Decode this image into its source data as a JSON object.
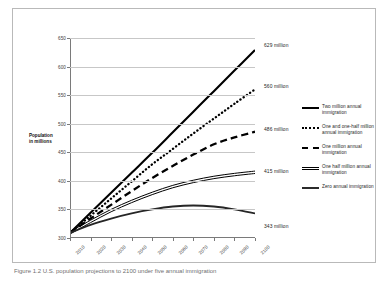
{
  "figure": {
    "caption": "Figure 1.2  U.S. population projections to 2100 under five annual immigration"
  },
  "axis": {
    "y_title_line1": "Population",
    "y_title_line2": "in millions"
  },
  "chart_data": {
    "type": "line",
    "title": "",
    "xlabel": "",
    "ylabel": "Population in millions",
    "xlim": [
      2010,
      2100
    ],
    "ylim": [
      300,
      650
    ],
    "ytick_step": 50,
    "grid": true,
    "legend_position": "right",
    "x": [
      2010,
      2020,
      2030,
      2040,
      2050,
      2060,
      2070,
      2080,
      2090,
      2100
    ],
    "xtick_labels": [
      "2010",
      "2020",
      "2030",
      "2040",
      "2050",
      "2060",
      "2070",
      "2080",
      "2090",
      "2100"
    ],
    "ytick_labels": [
      "300",
      "350",
      "400",
      "450",
      "500",
      "550",
      "600",
      "650"
    ],
    "series": [
      {
        "name": "Two million annual immigration",
        "style": "solid-thick",
        "end_label": "629 million",
        "end_value": 629,
        "values": [
          309,
          344,
          379,
          414,
          449,
          485,
          521,
          557,
          593,
          629
        ]
      },
      {
        "name": "One and one-half million annual immigration",
        "style": "dotted",
        "end_label": "560 million",
        "end_value": 560,
        "values": [
          309,
          339,
          369,
          399,
          429,
          456,
          483,
          509,
          535,
          560
        ]
      },
      {
        "name": "One million annual immigration",
        "style": "dashed",
        "end_label": "486 million",
        "end_value": 486,
        "values": [
          309,
          334,
          358,
          382,
          405,
          426,
          446,
          464,
          476,
          486
        ]
      },
      {
        "name": "One half million annual immigration",
        "style": "double-line",
        "end_label": "415 million",
        "end_value": 415,
        "values": [
          309,
          329,
          348,
          364,
          378,
          390,
          399,
          406,
          411,
          415
        ]
      },
      {
        "name": "Zero annual immigration",
        "style": "solid-medium",
        "end_label": "343 million",
        "end_value": 343,
        "values": [
          309,
          323,
          334,
          343,
          350,
          355,
          357,
          355,
          350,
          343
        ]
      }
    ]
  }
}
